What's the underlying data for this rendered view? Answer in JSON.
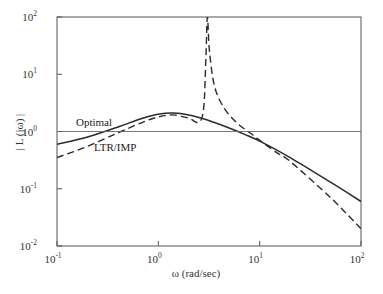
{
  "chart_data": {
    "type": "line",
    "title": "",
    "xlabel": "ω (rad/sec)",
    "ylabel": "| L (jω) |",
    "xscale": "log",
    "yscale": "log",
    "xlim": [
      0.1,
      100
    ],
    "ylim": [
      0.01,
      100
    ],
    "grid": false,
    "legend": "none (inline annotations)",
    "x_ticks": [
      {
        "base": "10",
        "exp": "-1",
        "value": 0.1
      },
      {
        "base": "10",
        "exp": "0",
        "value": 1
      },
      {
        "base": "10",
        "exp": "1",
        "value": 10
      },
      {
        "base": "10",
        "exp": "2",
        "value": 100
      }
    ],
    "y_ticks": [
      {
        "base": "10",
        "exp": "-2",
        "value": 0.01
      },
      {
        "base": "10",
        "exp": "-1",
        "value": 0.1
      },
      {
        "base": "10",
        "exp": "0",
        "value": 1
      },
      {
        "base": "10",
        "exp": "1",
        "value": 10
      },
      {
        "base": "10",
        "exp": "2",
        "value": 100
      }
    ],
    "annotations": [
      {
        "text": "Optimal",
        "near": "solid curve, x≈0.2, y≈1.1"
      },
      {
        "text": "LTR/IMP",
        "near": "dashed curve, x≈0.45, y≈0.35"
      }
    ],
    "series": [
      {
        "name": "Optimal",
        "style": "solid",
        "x": [
          0.1,
          0.2,
          0.4,
          0.7,
          1.0,
          1.4,
          2.0,
          3.0,
          5.0,
          7.0,
          10.0,
          20.0,
          50.0,
          100.0
        ],
        "y": [
          0.6,
          0.8,
          1.2,
          1.7,
          2.0,
          2.1,
          1.95,
          1.6,
          1.15,
          0.9,
          0.68,
          0.35,
          0.13,
          0.06
        ]
      },
      {
        "name": "LTR/IMP",
        "style": "dashed",
        "x": [
          0.1,
          0.2,
          0.4,
          0.7,
          1.0,
          1.4,
          2.0,
          2.5,
          2.8,
          2.95,
          3.05,
          3.2,
          3.6,
          4.5,
          6.0,
          8.0,
          10.0,
          15.0,
          20.0,
          50.0,
          100.0
        ],
        "y": [
          0.35,
          0.55,
          0.95,
          1.45,
          1.8,
          1.95,
          1.7,
          1.45,
          2.5,
          20,
          100,
          25,
          6,
          2.5,
          1.4,
          0.95,
          0.7,
          0.42,
          0.3,
          0.07,
          0.02
        ]
      },
      {
        "name": "Unity reference",
        "style": "thin solid",
        "x": [
          0.1,
          100.0
        ],
        "y": [
          1.0,
          1.0
        ]
      }
    ]
  }
}
